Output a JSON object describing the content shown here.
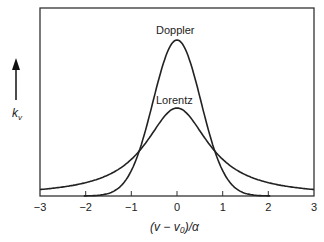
{
  "chart_data": {
    "type": "line",
    "title": "",
    "xlabel": "(ν − ν0)/α",
    "ylabel": "kν",
    "xlim": [
      -3,
      3
    ],
    "x_ticks": [
      "−3",
      "−2",
      "−1",
      "0",
      "1",
      "2",
      "3"
    ],
    "grid": false,
    "series": [
      {
        "name": "Doppler",
        "x": [
          -2,
          -1.5,
          -1,
          -0.5,
          0,
          0.5,
          1,
          1.5,
          2
        ],
        "values": [
          0.0,
          0.07,
          0.24,
          0.62,
          1.0,
          0.62,
          0.24,
          0.07,
          0.0
        ]
      },
      {
        "name": "Lorentz",
        "x": [
          -3,
          -2,
          -1,
          -0.5,
          0,
          0.5,
          1,
          2,
          3
        ],
        "values": [
          0.05,
          0.12,
          0.24,
          0.45,
          0.56,
          0.45,
          0.24,
          0.12,
          0.05
        ]
      }
    ],
    "annotations": [
      "Doppler",
      "Lorentz"
    ]
  },
  "labels": {
    "doppler": "Doppler",
    "lorentz": "Lorentz",
    "ylabel": "k",
    "ylabel_sub": "v",
    "xlabel": "(v − v₀)/α"
  },
  "ticks": [
    "−3",
    "−2",
    "−1",
    "0",
    "1",
    "2",
    "3"
  ]
}
